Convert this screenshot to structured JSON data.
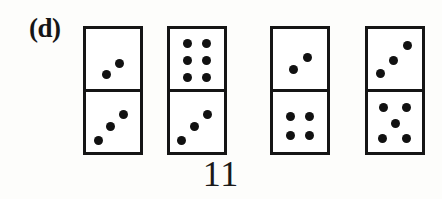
{
  "figure": {
    "panel_label": "(d)",
    "total_label": "11",
    "background_color": "#fdfdfb",
    "ink_color": "#151515",
    "pip_color": "#111111",
    "tile_fill_color": "#ffffff"
  },
  "dominoes": [
    {
      "name": "domino-1",
      "left": 83,
      "top_value": 2,
      "bottom_value": 3,
      "sum": 5,
      "top_pips": [
        {
          "x": 62,
          "y": 58
        },
        {
          "x": 38,
          "y": 76
        }
      ],
      "bottom_pips": [
        {
          "x": 70,
          "y": 38
        },
        {
          "x": 46,
          "y": 58
        },
        {
          "x": 24,
          "y": 80
        }
      ]
    },
    {
      "name": "domino-2",
      "left": 167,
      "top_value": 6,
      "bottom_value": 3,
      "sum": 9,
      "top_pips": [
        {
          "x": 32,
          "y": 24
        },
        {
          "x": 68,
          "y": 24
        },
        {
          "x": 32,
          "y": 52
        },
        {
          "x": 68,
          "y": 52
        },
        {
          "x": 32,
          "y": 80
        },
        {
          "x": 68,
          "y": 80
        }
      ],
      "bottom_pips": [
        {
          "x": 70,
          "y": 38
        },
        {
          "x": 46,
          "y": 58
        },
        {
          "x": 22,
          "y": 80
        }
      ]
    },
    {
      "name": "domino-3",
      "left": 270,
      "top_value": 2,
      "bottom_value": 4,
      "sum": 6,
      "top_pips": [
        {
          "x": 64,
          "y": 48
        },
        {
          "x": 38,
          "y": 68
        }
      ],
      "bottom_pips": [
        {
          "x": 32,
          "y": 40
        },
        {
          "x": 68,
          "y": 40
        },
        {
          "x": 32,
          "y": 72
        },
        {
          "x": 68,
          "y": 72
        }
      ]
    },
    {
      "name": "domino-4",
      "left": 365,
      "top_value": 3,
      "bottom_value": 5,
      "sum": 8,
      "top_pips": [
        {
          "x": 74,
          "y": 28
        },
        {
          "x": 48,
          "y": 52
        },
        {
          "x": 24,
          "y": 74
        }
      ],
      "bottom_pips": [
        {
          "x": 28,
          "y": 26
        },
        {
          "x": 72,
          "y": 26
        },
        {
          "x": 50,
          "y": 52
        },
        {
          "x": 26,
          "y": 78
        },
        {
          "x": 72,
          "y": 78
        }
      ]
    }
  ]
}
